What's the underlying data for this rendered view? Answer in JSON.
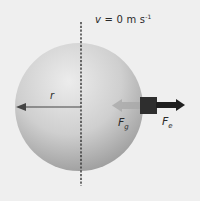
{
  "diagram": {
    "velocity_label": {
      "text": "v = 0 m s",
      "superscript": "-1"
    },
    "radius_label": "r",
    "force_inner": {
      "symbol": "F",
      "subscript": "g"
    },
    "force_outer": {
      "symbol": "F",
      "subscript": "e"
    },
    "colors": {
      "background": "#efefef",
      "sphere_light": "#e8e8e8",
      "sphere_dark": "#9a9a9a",
      "block": "#2e2e2e",
      "outer_arrow": "#1f1f1f",
      "inner_arrow": "#a8a8a8",
      "axis_line": "#333333",
      "radius_arrow": "#444444"
    }
  }
}
